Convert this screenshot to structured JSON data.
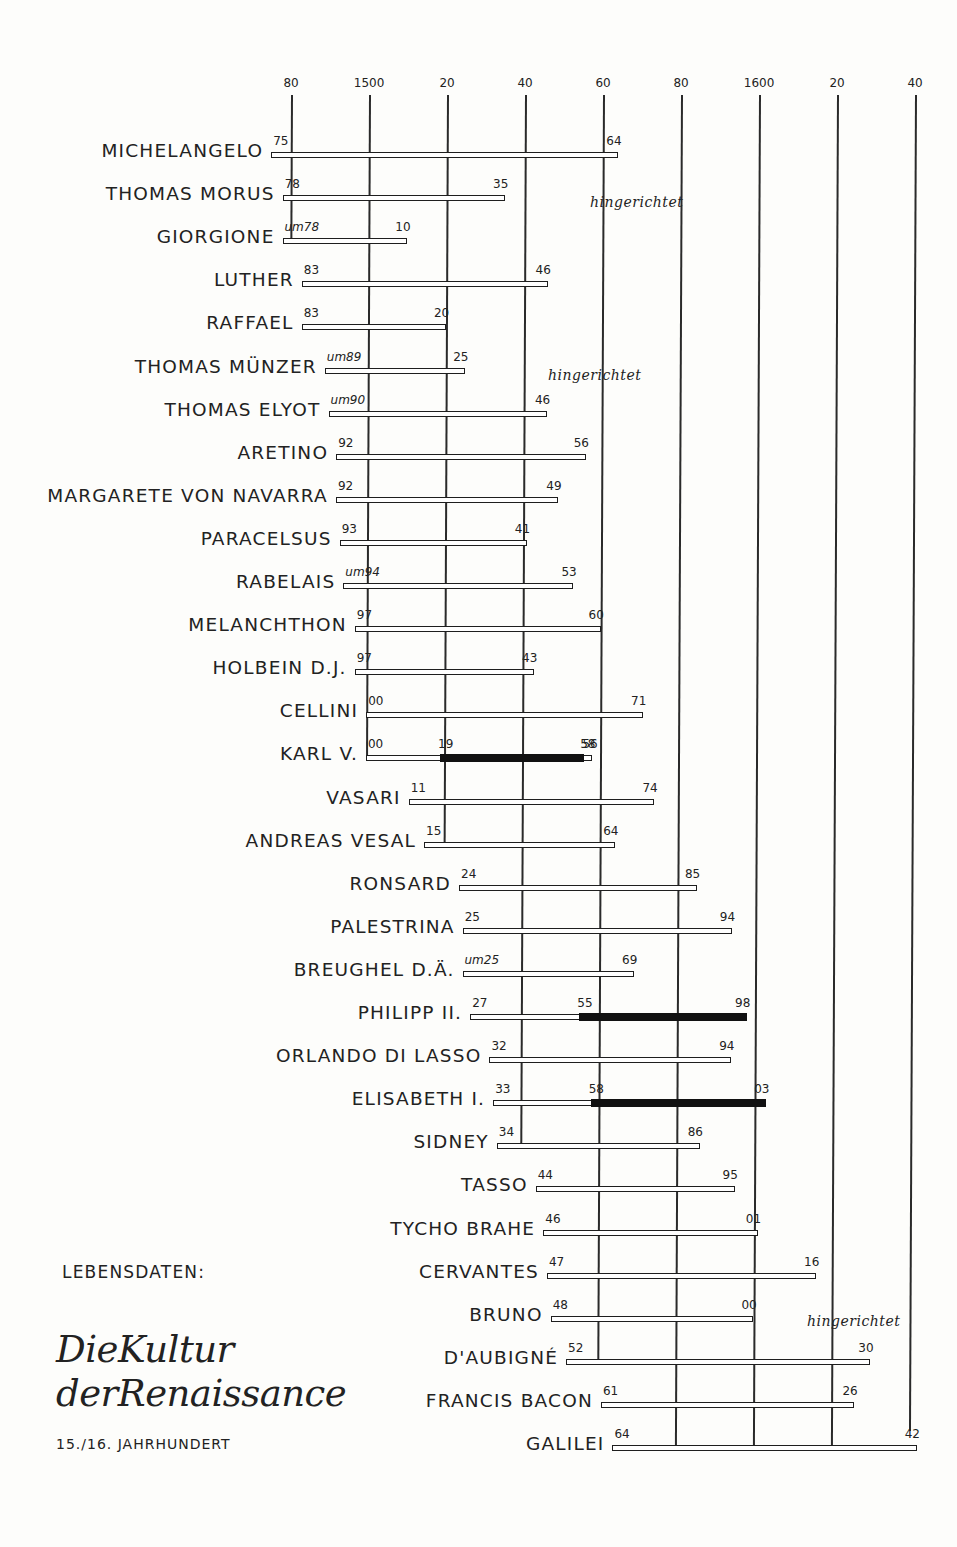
{
  "chart_data": {
    "type": "timeline",
    "subtitle": "15./16. Jahrhundert",
    "legend_label": "LEBENSDATEN:",
    "xlabel": "",
    "ylabel": "",
    "axis": {
      "range": [
        1480,
        1640
      ],
      "ticks": [
        {
          "year": 1480,
          "label": "80"
        },
        {
          "year": 1500,
          "label": "1500"
        },
        {
          "year": 1520,
          "label": "20"
        },
        {
          "year": 1540,
          "label": "40"
        },
        {
          "year": 1560,
          "label": "60"
        },
        {
          "year": 1580,
          "label": "80"
        },
        {
          "year": 1600,
          "label": "1600"
        },
        {
          "year": 1620,
          "label": "20"
        },
        {
          "year": 1640,
          "label": "40"
        }
      ],
      "grid": true
    },
    "series": [
      {
        "name": "MICHELANGELO",
        "born": 1475,
        "died": 1564,
        "born_label": "75",
        "died_label": "64"
      },
      {
        "name": "THOMAS MORUS",
        "born": 1478,
        "died": 1535,
        "born_label": "78",
        "died_label": "35",
        "note": "hingerichtet"
      },
      {
        "name": "GIORGIONE",
        "born": 1478,
        "died": 1510,
        "born_label": "um 78",
        "died_label": "10",
        "approx": true
      },
      {
        "name": "LUTHER",
        "born": 1483,
        "died": 1546,
        "born_label": "83",
        "died_label": "46"
      },
      {
        "name": "RAFFAEL",
        "born": 1483,
        "died": 1520,
        "born_label": "83",
        "died_label": "20"
      },
      {
        "name": "THOMAS MÜNZER",
        "born": 1489,
        "died": 1525,
        "born_label": "um 89",
        "died_label": "25",
        "approx": true,
        "note": "hingerichtet"
      },
      {
        "name": "THOMAS ELYOT",
        "born": 1490,
        "died": 1546,
        "born_label": "um 90",
        "died_label": "46",
        "approx": true
      },
      {
        "name": "ARETINO",
        "born": 1492,
        "died": 1556,
        "born_label": "92",
        "died_label": "56"
      },
      {
        "name": "MARGARETE VON NAVARRA",
        "born": 1492,
        "died": 1549,
        "born_label": "92",
        "died_label": "49"
      },
      {
        "name": "PARACELSUS",
        "born": 1493,
        "died": 1541,
        "born_label": "93",
        "died_label": "41"
      },
      {
        "name": "RABELAIS",
        "born": 1494,
        "died": 1553,
        "born_label": "um 94",
        "died_label": "53",
        "approx": true
      },
      {
        "name": "MELANCHTHON",
        "born": 1497,
        "died": 1560,
        "born_label": "97",
        "died_label": "60"
      },
      {
        "name": "HOLBEIN D.J.",
        "born": 1497,
        "died": 1543,
        "born_label": "97",
        "died_label": "43"
      },
      {
        "name": "CELLINI",
        "born": 1500,
        "died": 1571,
        "born_label": "00",
        "died_label": "71"
      },
      {
        "name": "KARL V.",
        "born": 1500,
        "died": 1558,
        "born_label": "00",
        "died_label": "58",
        "reign": [
          1519,
          1556
        ],
        "reign_labels": [
          "19",
          "56"
        ]
      },
      {
        "name": "VASARI",
        "born": 1511,
        "died": 1574,
        "born_label": "11",
        "died_label": "74"
      },
      {
        "name": "ANDREAS VESAL",
        "born": 1515,
        "died": 1564,
        "born_label": "15",
        "died_label": "64"
      },
      {
        "name": "RONSARD",
        "born": 1524,
        "died": 1585,
        "born_label": "24",
        "died_label": "85"
      },
      {
        "name": "PALESTRINA",
        "born": 1525,
        "died": 1594,
        "born_label": "25",
        "died_label": "94"
      },
      {
        "name": "BREUGHEL D.Ä.",
        "born": 1525,
        "died": 1569,
        "born_label": "um 25",
        "died_label": "69",
        "approx": true
      },
      {
        "name": "PHILIPP II.",
        "born": 1527,
        "died": 1598,
        "born_label": "27",
        "died_label": "98",
        "reign": [
          1555,
          1598
        ],
        "reign_labels": [
          "55",
          ""
        ]
      },
      {
        "name": "ORLANDO DI LASSO",
        "born": 1532,
        "died": 1594,
        "born_label": "32",
        "died_label": "94"
      },
      {
        "name": "ELISABETH I.",
        "born": 1533,
        "died": 1603,
        "born_label": "33",
        "died_label": "03",
        "reign": [
          1558,
          1603
        ],
        "reign_labels": [
          "58",
          ""
        ]
      },
      {
        "name": "SIDNEY",
        "born": 1534,
        "died": 1586,
        "born_label": "34",
        "died_label": "86"
      },
      {
        "name": "TASSO",
        "born": 1544,
        "died": 1595,
        "born_label": "44",
        "died_label": "95"
      },
      {
        "name": "TYCHO BRAHE",
        "born": 1546,
        "died": 1601,
        "born_label": "46",
        "died_label": "01"
      },
      {
        "name": "CERVANTES",
        "born": 1547,
        "died": 1616,
        "born_label": "47",
        "died_label": "16"
      },
      {
        "name": "BRUNO",
        "born": 1548,
        "died": 1600,
        "born_label": "48",
        "died_label": "00",
        "note": "hingerichtet"
      },
      {
        "name": "D'AUBIGNÉ",
        "born": 1552,
        "died": 1630,
        "born_label": "52",
        "died_label": "30"
      },
      {
        "name": "FRANCIS BACON",
        "born": 1561,
        "died": 1626,
        "born_label": "61",
        "died_label": "26"
      },
      {
        "name": "GALILEI",
        "born": 1564,
        "died": 1642,
        "born_label": "64",
        "died_label": "42"
      }
    ]
  },
  "page": {
    "legend_label": "LEBENSDATEN:",
    "title_line1": "DieKultur",
    "title_line2": "derRenaissance",
    "century": "15./16. JAHRHUNDERT",
    "note_text": "hingerichtet"
  }
}
